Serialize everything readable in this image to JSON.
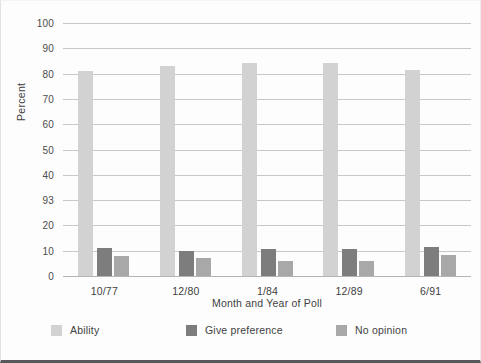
{
  "chart_data": {
    "type": "bar",
    "title": "",
    "xlabel": "Month and Year of Poll",
    "ylabel": "Percent",
    "ylim": [
      0,
      100
    ],
    "grid": true,
    "legend_position": "bottom",
    "categories": [
      "10/77",
      "12/80",
      "1/84",
      "12/89",
      "6/91"
    ],
    "ytick_labels": [
      "0",
      "10",
      "20",
      "93",
      "40",
      "50",
      "60",
      "70",
      "80",
      "90",
      "100"
    ],
    "ytick_values": [
      0,
      10,
      20,
      30,
      40,
      50,
      60,
      70,
      80,
      90,
      100
    ],
    "series": [
      {
        "name": "Ability",
        "color": "#d2d2d2",
        "values": [
          81,
          83,
          84,
          84,
          81.5
        ]
      },
      {
        "name": "Give preference",
        "color": "#7d7d7d",
        "values": [
          11,
          10,
          10.5,
          10.5,
          11.5
        ]
      },
      {
        "name": "No opinion",
        "color": "#a8a8a8",
        "values": [
          8,
          7,
          6,
          6,
          8.5
        ]
      }
    ]
  }
}
